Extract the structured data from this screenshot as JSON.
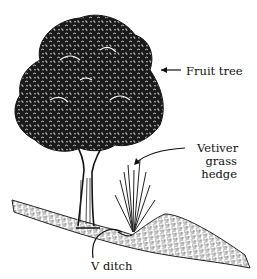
{
  "diagram": {
    "type": "labeled-illustration",
    "colors": {
      "ink": "#111111",
      "background": "#ffffff"
    },
    "labels": {
      "fruit_tree": "Fruit tree",
      "vetiver": [
        "Vetiver",
        "grass",
        "hedge"
      ],
      "v_ditch": "V ditch"
    },
    "callouts": [
      {
        "label": "Fruit tree",
        "style": "straight-arrow",
        "points_to": "tree canopy"
      },
      {
        "label": "Vetiver grass hedge",
        "style": "curved-arrow",
        "points_to": "grass clump"
      },
      {
        "label": "V ditch",
        "style": "curved-line",
        "points_to": "ditch in slope"
      }
    ]
  }
}
